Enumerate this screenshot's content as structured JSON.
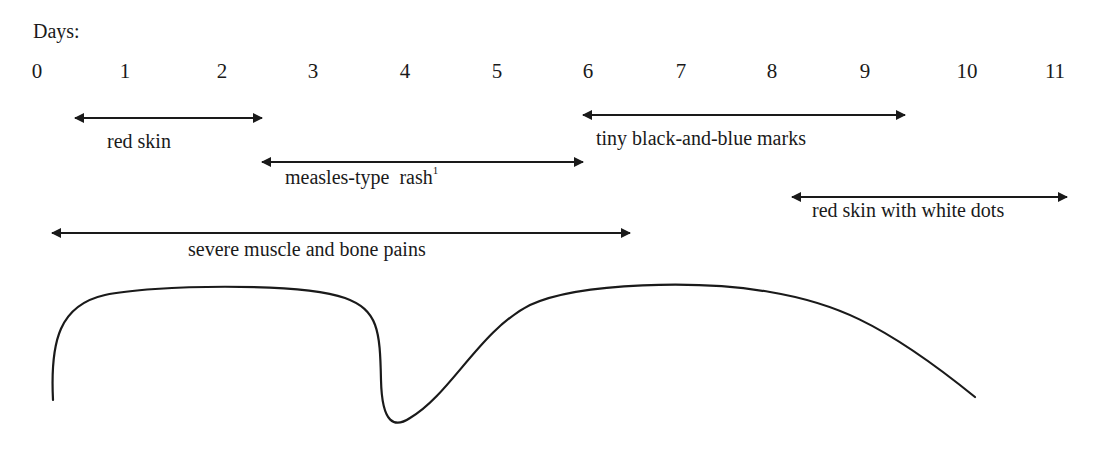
{
  "axis": {
    "label": "Days:",
    "ticks": [
      "0",
      "1",
      "2",
      "3",
      "4",
      "5",
      "6",
      "7",
      "8",
      "9",
      "10",
      "11"
    ],
    "tick_x": [
      37,
      125,
      222,
      313,
      405,
      497,
      588,
      681,
      772,
      865,
      967,
      1055
    ]
  },
  "intervals": [
    {
      "id": "red-skin",
      "label": "red skin",
      "start_day": 0.4,
      "end_day": 2.4,
      "x1": 75,
      "x2": 262,
      "y": 118,
      "label_x": 107,
      "label_y": 130
    },
    {
      "id": "measles-rash",
      "label": "measles-type  rash",
      "footnote": "1",
      "start_day": 2.4,
      "end_day": 5.9,
      "x1": 262,
      "x2": 583,
      "y": 162,
      "label_x": 285,
      "label_y": 172
    },
    {
      "id": "black-blue-marks",
      "label": "tiny black-and-blue marks",
      "start_day": 5.9,
      "end_day": 9.4,
      "x1": 583,
      "x2": 905,
      "y": 115,
      "label_x": 596,
      "label_y": 127
    },
    {
      "id": "red-skin-white-dots",
      "label": "red skin with white dots",
      "start_day": 8.2,
      "end_day": 11.1,
      "x1": 792,
      "x2": 1067,
      "y": 197,
      "label_x": 812,
      "label_y": 201
    },
    {
      "id": "muscle-bone-pains",
      "label": "severe muscle and bone pains",
      "start_day": 0.2,
      "end_day": 6.4,
      "x1": 52,
      "x2": 630,
      "y": 233,
      "label_x": 188,
      "label_y": 240
    }
  ],
  "curve": {
    "description": "fever curve: rises, plateaus, drops sharply near day 4, then rises again and falls by day 10",
    "path": "M 53 400 C 50 340, 60 305, 105 295 C 150 285, 300 282, 345 298 C 378 310, 380 330, 381 380 C 382 425, 395 428, 410 418 C 450 395, 480 330, 530 305 C 580 282, 700 280, 770 292 C 830 302, 880 320, 975 397",
    "stroke": "#1a1a1a"
  },
  "colors": {
    "ink": "#1a1a1a",
    "background": "#ffffff"
  }
}
